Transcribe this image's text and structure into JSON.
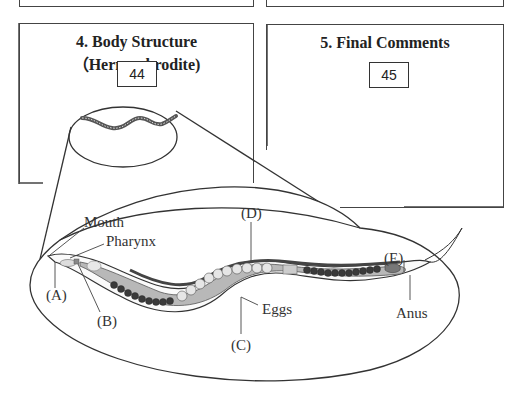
{
  "boxes": [
    {
      "id": "prev-left",
      "title": "",
      "number": ""
    },
    {
      "id": "prev-right",
      "title": "",
      "number": ""
    },
    {
      "id": "body-structure",
      "title": "4. Body Structure（Hermaphrodite)",
      "number": "44"
    },
    {
      "id": "final-comments",
      "title": "5. Final Comments",
      "number": "45"
    }
  ],
  "diagram": {
    "labels": {
      "mouth": "Mouth",
      "pharynx": "Pharynx",
      "a": "(A)",
      "b": "(B)",
      "c": "(C)",
      "d": "(D)",
      "e": "(E)",
      "eggs": "Eggs",
      "anus": "Anus"
    },
    "colors": {
      "outline": "#333333",
      "body_light": "#b8b8b8",
      "gut_dark": "#555555",
      "egg_fill": "#e6e6e6",
      "oocyte_dark": "#3a3a3a"
    }
  }
}
